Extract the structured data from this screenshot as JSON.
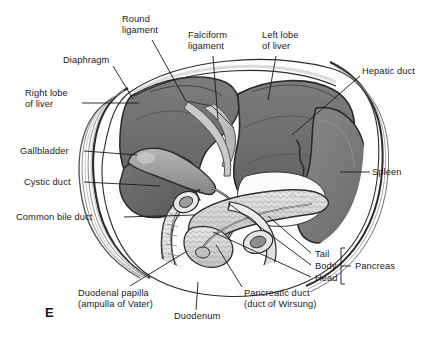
{
  "figure": {
    "panel_letter": "E",
    "type": "anatomical-illustration",
    "background_color": "#ffffff",
    "line_color": "#1a1a1a",
    "organ_colors": {
      "liver": "#6d6d6d",
      "liver_dark_edge": "#3a3a3a",
      "gallbladder": "#9a9a9a",
      "spleen": "#7b7b7b",
      "pancreas": "#d8d8d8",
      "duodenum": "#ececec",
      "diaphragm": "#cfcfcf",
      "ligament": "#c8c8c8"
    }
  },
  "labels": [
    {
      "id": "round-ligament",
      "text": "Round\nligament",
      "x": 122,
      "y": 14,
      "align": "left"
    },
    {
      "id": "falciform-ligament",
      "text": "Falciform\nligament",
      "x": 188,
      "y": 30,
      "align": "left"
    },
    {
      "id": "left-lobe-of-liver",
      "text": "Left lobe\nof liver",
      "x": 262,
      "y": 30,
      "align": "left"
    },
    {
      "id": "hepatic-duct",
      "text": "Hepatic duct",
      "x": 362,
      "y": 71,
      "align": "left"
    },
    {
      "id": "diaphragm",
      "text": "Diaphragm",
      "x": 63,
      "y": 55,
      "align": "left"
    },
    {
      "id": "right-lobe-of-liver",
      "text": "Right lobe\nof liver",
      "x": 25,
      "y": 88,
      "align": "left"
    },
    {
      "id": "gallbladder",
      "text": "Gallbladder",
      "x": 20,
      "y": 146,
      "align": "left"
    },
    {
      "id": "cystic-duct",
      "text": "Cystic duct",
      "x": 24,
      "y": 177,
      "align": "left"
    },
    {
      "id": "common-bile-duct",
      "text": "Common bile duct",
      "x": 16,
      "y": 212,
      "align": "left"
    },
    {
      "id": "spleen",
      "text": "Spleen",
      "x": 372,
      "y": 168,
      "align": "left"
    },
    {
      "id": "tail",
      "text": "Tail",
      "x": 313,
      "y": 254,
      "align": "left"
    },
    {
      "id": "body",
      "text": "Body",
      "x": 313,
      "y": 266,
      "align": "left"
    },
    {
      "id": "head",
      "text": "Head",
      "x": 313,
      "y": 278,
      "align": "left"
    },
    {
      "id": "pancreas",
      "text": "Pancreas",
      "x": 355,
      "y": 266,
      "align": "left"
    },
    {
      "id": "duodenal-papilla",
      "text": "Duodenal papilla\n(ampulla of Vater)",
      "x": 78,
      "y": 291,
      "align": "left"
    },
    {
      "id": "duodenum",
      "text": "Duodenum",
      "x": 174,
      "y": 314,
      "align": "left"
    },
    {
      "id": "pancreatic-duct",
      "text": "Pancreatic duct\n(duct of Wirsung)",
      "x": 244,
      "y": 291,
      "align": "left"
    }
  ],
  "leader_lines": [
    {
      "id": "round-ligament-leader",
      "points": "152,40 186,101"
    },
    {
      "id": "falciform-ligament-leader",
      "points": "213,56 218,120"
    },
    {
      "id": "left-lobe-leader",
      "points": "276,56 268,100"
    },
    {
      "id": "hepatic-duct-leader",
      "points": "360,76 292,135"
    },
    {
      "id": "diaphragm-leader",
      "points": "113,66 133,99"
    },
    {
      "id": "right-lobe-leader",
      "points": "82,103 139,103"
    },
    {
      "id": "gallbladder-leader",
      "points": "84,151 137,155"
    },
    {
      "id": "cystic-duct-leader",
      "points": "84,182 160,186"
    },
    {
      "id": "common-bile-duct-leader",
      "points": "124,217 195,215"
    },
    {
      "id": "spleen-leader",
      "points": "370,172 340,172"
    },
    {
      "id": "tail-leader",
      "points": "311,253 268,216"
    },
    {
      "id": "body-leader",
      "points": "311,265 228,203"
    },
    {
      "id": "head-leader",
      "points": "311,277 213,232"
    },
    {
      "id": "duodenal-papilla-leader",
      "points": "130,286 187,251"
    },
    {
      "id": "duodenum-leader",
      "points": "196,310 198,282"
    },
    {
      "id": "pancreatic-duct-leader",
      "points": "242,287 216,245"
    }
  ],
  "brace": {
    "id": "pancreas-brace",
    "x": 341,
    "y_top": 248,
    "y_bottom": 284,
    "tick_x": 350,
    "tick_y": 266
  }
}
